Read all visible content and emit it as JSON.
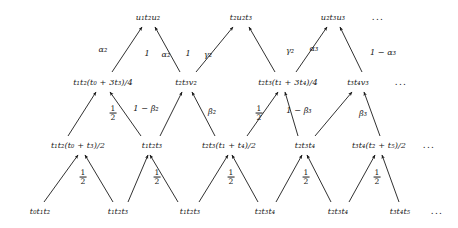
{
  "figure": {
    "type": "lattice-trellis-diagram",
    "width": 458,
    "height": 228,
    "background": "#ffffff",
    "ink": "#1a1a1a",
    "ellipsis": "..."
  },
  "rows": [
    {
      "name": "row-top",
      "index": 0,
      "y": 17,
      "nodes": [
        {
          "id": "r0n0",
          "x": 148,
          "label": "u₁t₂u₂"
        },
        {
          "id": "r0n1",
          "x": 241,
          "label": "t₂u₂t₃"
        },
        {
          "id": "r0n2",
          "x": 333,
          "label": "u₂t₃u₃"
        },
        {
          "id": "r0n3",
          "x": 378,
          "label": "...",
          "is_ellipsis": true
        }
      ]
    },
    {
      "name": "row-upper-middle",
      "index": 1,
      "y": 82,
      "nodes": [
        {
          "id": "r1n0",
          "x": 103,
          "label": "t₁t₂(t₀ + 3t₃)/4"
        },
        {
          "id": "r1n1",
          "x": 186,
          "label": "t₂t₃v₂"
        },
        {
          "id": "r1n2",
          "x": 288,
          "label": "t₂t₃(t₁ + 3t₄)/4"
        },
        {
          "id": "r1n3",
          "x": 358,
          "label": "t₃t₄v₃"
        },
        {
          "id": "r1n4",
          "x": 401,
          "label": "...",
          "is_ellipsis": true
        }
      ]
    },
    {
      "name": "row-lower-middle",
      "index": 2,
      "y": 145,
      "nodes": [
        {
          "id": "r2n0",
          "x": 78,
          "label": "t₁t₂(t₀ + t₃)/2"
        },
        {
          "id": "r2n1",
          "x": 152,
          "label": "t₁t₂t₃"
        },
        {
          "id": "r2n2",
          "x": 229,
          "label": "t₂t₃(t₁ + t₄)/2"
        },
        {
          "id": "r2n3",
          "x": 305,
          "label": "t₂t₃t₄"
        },
        {
          "id": "r2n4",
          "x": 379,
          "label": "t₃t₄(t₂ + t₅)/2"
        },
        {
          "id": "r2n5",
          "x": 429,
          "label": "...",
          "is_ellipsis": true
        }
      ]
    },
    {
      "name": "row-bottom",
      "index": 3,
      "y": 211,
      "nodes": [
        {
          "id": "r3n0",
          "x": 40,
          "label": "t₀t₁t₂"
        },
        {
          "id": "r3n1",
          "x": 118,
          "label": "t₁t₂t₃"
        },
        {
          "id": "r3n2",
          "x": 190,
          "label": "t₁t₂t₃"
        },
        {
          "id": "r3n3",
          "x": 265,
          "label": "t₂t₃t₄"
        },
        {
          "id": "r3n4",
          "x": 338,
          "label": "t₂t₃t₄"
        },
        {
          "id": "r3n5",
          "x": 400,
          "label": "t₃t₄t₅"
        },
        {
          "id": "r3n6",
          "x": 437,
          "label": "...",
          "is_ellipsis": true
        }
      ]
    }
  ],
  "edges": [
    {
      "id": "e-b0",
      "from": "r3n0",
      "to": "r2n0",
      "x1": 44,
      "y1": 202,
      "x2": 78,
      "y2": 155,
      "weight": null
    },
    {
      "id": "e-b1",
      "from": "r3n1",
      "to": "r2n0",
      "x1": 113,
      "y1": 202,
      "x2": 85,
      "y2": 155,
      "weight": "1/2"
    },
    {
      "id": "e-b2",
      "from": "r3n2",
      "to": "r2n1",
      "x1": 178,
      "y1": 202,
      "x2": 150,
      "y2": 155,
      "weight": null
    },
    {
      "id": "e-b3",
      "from": "r3n2",
      "to": "r2n2",
      "x1": 199,
      "y1": 202,
      "x2": 228,
      "y2": 155,
      "weight": "1/2"
    },
    {
      "id": "e-b4",
      "from": "r3n3",
      "to": "r2n2",
      "x1": 258,
      "y1": 202,
      "x2": 232,
      "y2": 155,
      "weight": null
    },
    {
      "id": "e-b5",
      "from": "r3n3",
      "to": "r2n3",
      "x1": 276,
      "y1": 202,
      "x2": 302,
      "y2": 155,
      "weight": "1/2"
    },
    {
      "id": "e-b6",
      "from": "r3n4",
      "to": "r2n3",
      "x1": 331,
      "y1": 202,
      "x2": 307,
      "y2": 155,
      "weight": null
    },
    {
      "id": "e-b7",
      "from": "r3n4",
      "to": "r2n4",
      "x1": 349,
      "y1": 202,
      "x2": 375,
      "y2": 155,
      "weight": "1/2"
    },
    {
      "id": "e-b8",
      "from": "r3n5",
      "to": "r2n4",
      "x1": 399,
      "y1": 202,
      "x2": 382,
      "y2": 155,
      "weight": null
    },
    {
      "id": "e-b-extra",
      "from": "r3n1",
      "to": "r2n1",
      "x1": 128,
      "y1": 202,
      "x2": 148,
      "y2": 155,
      "weight": null
    },
    {
      "id": "e-m0",
      "from": "r2n0",
      "to": "r1n0",
      "x1": 68,
      "y1": 136,
      "x2": 96,
      "y2": 92,
      "weight": null
    },
    {
      "id": "e-m1",
      "from": "r2n1",
      "to": "r1n0",
      "x1": 141,
      "y1": 136,
      "x2": 110,
      "y2": 92,
      "weight": "1/2"
    },
    {
      "id": "e-m2",
      "from": "r2n1",
      "to": "r1n1",
      "x1": 160,
      "y1": 136,
      "x2": 182,
      "y2": 92,
      "weight": "1-beta2"
    },
    {
      "id": "e-m3",
      "from": "r2n2",
      "to": "r1n1",
      "x1": 215,
      "y1": 136,
      "x2": 192,
      "y2": 92,
      "weight": null
    },
    {
      "id": "e-m4",
      "from": "r2n2",
      "to": "r1n2",
      "x1": 247,
      "y1": 136,
      "x2": 278,
      "y2": 92,
      "weight": "beta2"
    },
    {
      "id": "e-m5",
      "from": "r2n3",
      "to": "r1n2",
      "x1": 298,
      "y1": 136,
      "x2": 285,
      "y2": 92,
      "weight": "1/2"
    },
    {
      "id": "e-m6",
      "from": "r2n3",
      "to": "r1n3",
      "x1": 315,
      "y1": 136,
      "x2": 352,
      "y2": 92,
      "weight": "1-beta3"
    },
    {
      "id": "e-m7",
      "from": "r2n4",
      "to": "r1n3",
      "x1": 380,
      "y1": 136,
      "x2": 364,
      "y2": 92,
      "weight": "beta3"
    },
    {
      "id": "e-t0",
      "from": "r1n0",
      "to": "r0n0",
      "x1": 112,
      "y1": 72,
      "x2": 142,
      "y2": 27,
      "weight": "alpha2"
    },
    {
      "id": "e-t1",
      "from": "r1n1",
      "to": "r0n0",
      "x1": 180,
      "y1": 72,
      "x2": 155,
      "y2": 27,
      "weight": "1-alpha2"
    },
    {
      "id": "e-t2",
      "from": "r1n1",
      "to": "r0n1",
      "x1": 196,
      "y1": 72,
      "x2": 233,
      "y2": 27,
      "weight": "1-gamma2"
    },
    {
      "id": "e-t3",
      "from": "r1n2",
      "to": "r0n1",
      "x1": 275,
      "y1": 72,
      "x2": 249,
      "y2": 27,
      "weight": "gamma2"
    },
    {
      "id": "e-t4",
      "from": "r1n2",
      "to": "r0n2",
      "x1": 296,
      "y1": 72,
      "x2": 327,
      "y2": 27,
      "weight": "alpha3"
    },
    {
      "id": "e-t5",
      "from": "r1n3",
      "to": "r0n2",
      "x1": 362,
      "y1": 72,
      "x2": 340,
      "y2": 27,
      "weight": "1-alpha3"
    }
  ],
  "weight_labels": [
    {
      "id": "w-b1",
      "x": 83,
      "y": 177,
      "kind": "fraction",
      "num": "1",
      "den": "2"
    },
    {
      "id": "w-b3",
      "x": 157,
      "y": 177,
      "kind": "fraction",
      "num": "1",
      "den": "2"
    },
    {
      "id": "w-b5",
      "x": 231,
      "y": 177,
      "kind": "fraction",
      "num": "1",
      "den": "2"
    },
    {
      "id": "w-b7",
      "x": 306,
      "y": 177,
      "kind": "fraction",
      "num": "1",
      "den": "2"
    },
    {
      "id": "w-b9",
      "x": 377,
      "y": 177,
      "kind": "fraction",
      "num": "1",
      "den": "2"
    },
    {
      "id": "w-m1",
      "x": 113,
      "y": 113,
      "kind": "fraction",
      "num": "1",
      "den": "2"
    },
    {
      "id": "w-m2-a",
      "x": 146,
      "y": 108,
      "kind": "text",
      "text": "1 − β₂"
    },
    {
      "id": "w-m4",
      "x": 212,
      "y": 111,
      "kind": "text",
      "text": "β₂"
    },
    {
      "id": "w-m5",
      "x": 259,
      "y": 113,
      "kind": "fraction",
      "num": "1",
      "den": "2"
    },
    {
      "id": "w-m6",
      "x": 299,
      "y": 110,
      "kind": "text",
      "text": "1 − β₃"
    },
    {
      "id": "w-m7",
      "x": 363,
      "y": 113,
      "kind": "text",
      "text": "β₃"
    },
    {
      "id": "w-t0",
      "x": 103,
      "y": 49,
      "kind": "text",
      "text": "α₂"
    },
    {
      "id": "w-t1-one",
      "x": 147,
      "y": 53,
      "kind": "text",
      "text": "1"
    },
    {
      "id": "w-t1-sym",
      "x": 166,
      "y": 54,
      "kind": "text",
      "text": "α₂"
    },
    {
      "id": "w-t2-one",
      "x": 188,
      "y": 53,
      "kind": "text",
      "text": "1"
    },
    {
      "id": "w-t2-sym",
      "x": 208,
      "y": 54,
      "kind": "text",
      "text": "γ₂"
    },
    {
      "id": "w-t3",
      "x": 290,
      "y": 50,
      "kind": "text",
      "text": "γ₂"
    },
    {
      "id": "w-t4",
      "x": 314,
      "y": 48,
      "kind": "text",
      "text": "α₃"
    },
    {
      "id": "w-t5",
      "x": 383,
      "y": 52,
      "kind": "text",
      "text": "1 − α₃"
    }
  ]
}
